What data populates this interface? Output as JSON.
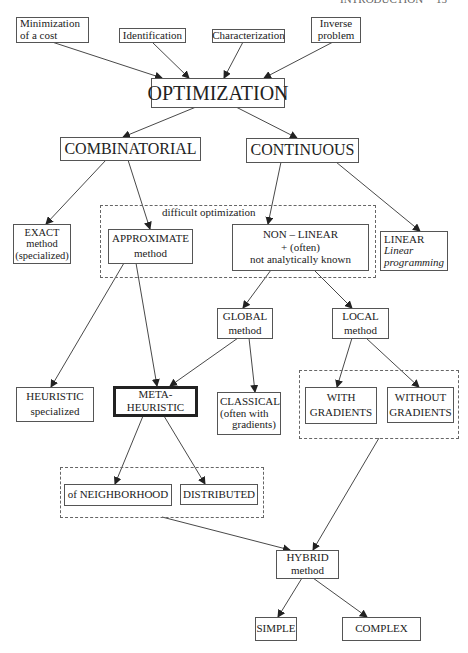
{
  "page_header": {
    "title": "INTRODUCTION",
    "page_number": "15"
  },
  "nodes": {
    "minimization": {
      "lines": [
        "Minimization",
        "of a cost"
      ]
    },
    "identification": {
      "lines": [
        "Identification"
      ]
    },
    "characterization": {
      "lines": [
        "Characterization"
      ]
    },
    "inverse": {
      "lines": [
        "Inverse",
        "problem"
      ]
    },
    "optimization": {
      "lines": [
        "OPTIMIZATION"
      ]
    },
    "combinatorial": {
      "lines": [
        "COMBINATORIAL"
      ]
    },
    "continuous": {
      "lines": [
        "CONTINUOUS"
      ]
    },
    "exact": {
      "lines": [
        "EXACT",
        "method",
        "(specialized)"
      ]
    },
    "approximate": {
      "lines": [
        "APPROXIMATE",
        "method"
      ]
    },
    "nonlinear": {
      "lines": [
        "NON – LINEAR",
        "+ (often)",
        "not analytically known"
      ]
    },
    "linear": {
      "lines": [
        "LINEAR",
        "Linear",
        "programming"
      ]
    },
    "global": {
      "lines": [
        "GLOBAL",
        "method"
      ]
    },
    "local": {
      "lines": [
        "LOCAL",
        "method"
      ]
    },
    "heuristic": {
      "lines": [
        "HEURISTIC",
        "specialized"
      ]
    },
    "metaheuristic": {
      "lines": [
        "META-",
        "HEURISTIC"
      ]
    },
    "classical": {
      "lines": [
        "CLASSICAL",
        "(often with",
        "gradients)"
      ]
    },
    "with_gradients": {
      "lines": [
        "WITH",
        "GRADIENTS"
      ]
    },
    "without_gradients": {
      "lines": [
        "WITHOUT",
        "GRADIENTS"
      ]
    },
    "neighborhood": {
      "lines": [
        "of NEIGHBORHOOD"
      ]
    },
    "distributed": {
      "lines": [
        "DISTRIBUTED"
      ]
    },
    "hybrid": {
      "lines": [
        "HYBRID",
        "method"
      ]
    },
    "simple": {
      "lines": [
        "SIMPLE"
      ]
    },
    "complex": {
      "lines": [
        "COMPLEX"
      ]
    }
  },
  "groups": {
    "difficult": {
      "label": "difficult optimization"
    }
  },
  "edges": [
    [
      "minimization",
      "optimization"
    ],
    [
      "identification",
      "optimization"
    ],
    [
      "characterization",
      "optimization"
    ],
    [
      "inverse",
      "optimization"
    ],
    [
      "optimization",
      "combinatorial"
    ],
    [
      "optimization",
      "continuous"
    ],
    [
      "combinatorial",
      "exact"
    ],
    [
      "combinatorial",
      "approximate"
    ],
    [
      "continuous",
      "nonlinear"
    ],
    [
      "continuous",
      "linear"
    ],
    [
      "nonlinear",
      "global"
    ],
    [
      "nonlinear",
      "local"
    ],
    [
      "approximate",
      "heuristic"
    ],
    [
      "approximate",
      "metaheuristic"
    ],
    [
      "global",
      "metaheuristic"
    ],
    [
      "global",
      "classical"
    ],
    [
      "local",
      "with_gradients"
    ],
    [
      "local",
      "without_gradients"
    ],
    [
      "metaheuristic",
      "neighborhood"
    ],
    [
      "metaheuristic",
      "distributed"
    ],
    [
      "neighborhood_distributed_group",
      "hybrid"
    ],
    [
      "gradients_group",
      "hybrid"
    ],
    [
      "hybrid",
      "simple"
    ],
    [
      "hybrid",
      "complex"
    ]
  ]
}
